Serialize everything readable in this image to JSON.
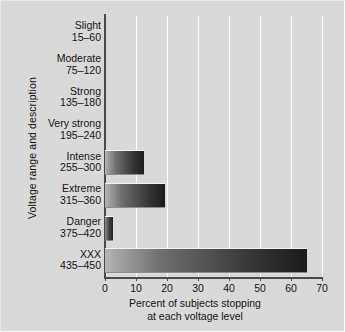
{
  "chart_data": {
    "type": "bar",
    "orientation": "horizontal",
    "title": "",
    "xlabel_line1": "Percent of subjects stopping",
    "xlabel_line2": "at each voltage level",
    "ylabel": "Voltage range and description",
    "categories": [
      {
        "name": "Slight",
        "range": "15–60"
      },
      {
        "name": "Moderate",
        "range": "75–120"
      },
      {
        "name": "Strong",
        "range": "135–180"
      },
      {
        "name": "Very strong",
        "range": "195–240"
      },
      {
        "name": "Intense",
        "range": "255–300"
      },
      {
        "name": "Extreme",
        "range": "315–360"
      },
      {
        "name": "Danger",
        "range": "375–420"
      },
      {
        "name": "XXX",
        "range": "435–450"
      }
    ],
    "values": [
      0,
      0,
      0,
      0,
      12.5,
      19.5,
      2.5,
      65
    ],
    "xticks": [
      0,
      10,
      20,
      30,
      40,
      50,
      60,
      70
    ],
    "xlim": [
      0,
      70
    ],
    "grid": true,
    "legend": "none",
    "colors": {
      "background": "#d9d9d9",
      "gridline": "#fafafa",
      "axis": "#4a4a4a",
      "bar_light": "#b4b4b4",
      "bar_dark": "#1c1c1c",
      "text": "#141414"
    }
  }
}
